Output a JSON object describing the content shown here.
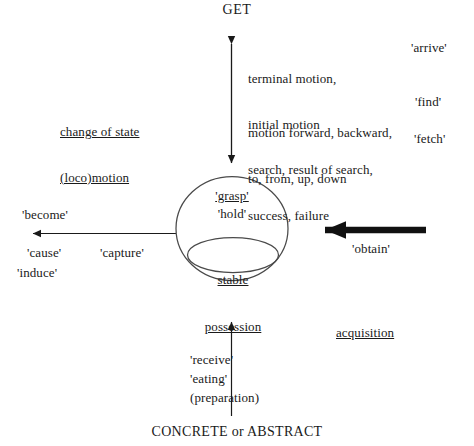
{
  "diagram": {
    "title": "GET",
    "bottom_caption": "CONCRETE or ABSTRACT",
    "colors": {
      "ink": "#1a1a1a",
      "background": "#ffffff",
      "stroke": "#4a4a4a"
    },
    "core": {
      "outer_labels": [
        "'grasp'",
        "'hold'"
      ],
      "grasp": "'grasp'",
      "hold": "'hold'",
      "inner_line_1": "stable",
      "inner_line_2": "possession"
    },
    "group_labels": {
      "locomotion_line_1": "change of state",
      "locomotion_line_2": "(loco)motion",
      "acquisition": "acquisition"
    },
    "top_branch": {
      "rows": [
        {
          "description_line_1": "terminal motion,",
          "description_line_2": "initial motion",
          "word": "'arrive'"
        },
        {
          "description_line_1": "motion forward, backward,",
          "description_line_2": "to, from, up, down",
          "word": "'find'"
        },
        {
          "description_line_1": "search, result of search,",
          "description_line_2": "success, failure",
          "word": "'fetch'"
        }
      ]
    },
    "left_branch": {
      "above_arrow": "'become'",
      "below_arrow_inner": "'cause'",
      "below_arrow_lower": "'induce'",
      "mid_word": "'capture'"
    },
    "right_branch": {
      "word": "'obtain'"
    },
    "bottom_branch": {
      "words": [
        "'receive'",
        "'eating'",
        "(preparation)"
      ],
      "receive": "'receive'",
      "eating": "'eating'",
      "preparation": "(preparation)"
    }
  }
}
